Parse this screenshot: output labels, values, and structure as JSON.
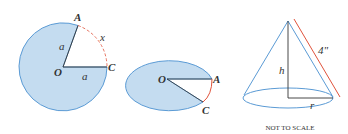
{
  "colors": {
    "fill": "#c4dcf0",
    "stroke_blue": "#5b9bd5",
    "stroke_dark": "#333333",
    "arc_red": "#e0533c"
  },
  "figure1": {
    "label_A": "A",
    "label_O": "O",
    "label_C": "C",
    "label_a_radius1": "a",
    "label_a_radius2": "a",
    "label_x": "x"
  },
  "figure2": {
    "label_O": "O",
    "label_A": "A",
    "label_C": "C"
  },
  "figure3": {
    "label_h": "h",
    "label_r": "r",
    "label_slant": "4\"",
    "note": "NOT TO SCALE"
  }
}
